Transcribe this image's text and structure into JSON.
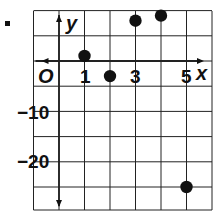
{
  "problem_marker": "■",
  "chart_data": {
    "type": "scatter",
    "title": "",
    "xlabel": "x",
    "ylabel": "y",
    "origin_label": "O",
    "x_tick_labels": [
      "1",
      "3",
      "5"
    ],
    "y_tick_labels": [
      "-10",
      "-20"
    ],
    "x_grid_step": 1,
    "y_grid_step": 5,
    "xlim": [
      -1,
      6
    ],
    "ylim": [
      -29,
      10
    ],
    "grid": true,
    "legend": "none",
    "points": [
      {
        "x": 1,
        "y": 1
      },
      {
        "x": 2,
        "y": -3
      },
      {
        "x": 3,
        "y": 8
      },
      {
        "x": 4,
        "y": 9
      },
      {
        "x": 5,
        "y": -25
      }
    ],
    "colors": {
      "grid": "#222222",
      "points": "#111111"
    }
  }
}
